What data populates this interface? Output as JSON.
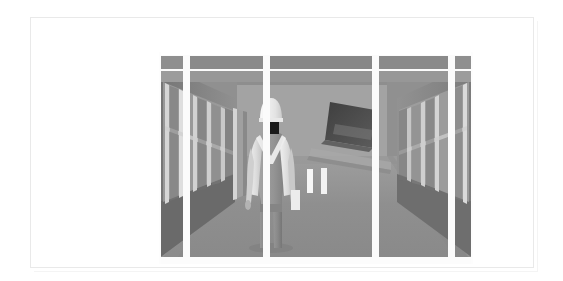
{
  "plate": {
    "background_color": "#ffffff",
    "frame_color": "#e9e9e9",
    "alt": "Greyscale 3D render: construction worker seen from behind standing in a corridor"
  },
  "scene": {
    "title": "corridor-3d-render",
    "description": "Greyscale architectural 3D render. A figure in a white hard hat and light overalls stands with their back to the viewer in the centre of a wide corridor. Glazed window walls recede in one-point perspective on both the left and right. A dark angled panel hangs from the ceiling to the right. Two small white vertical markers stand on the floor to the right of the figure.",
    "view": "one-point perspective, eye level",
    "palette": {
      "floor": "#8d8d8d",
      "floor_far": "#9d9d9d",
      "ceiling_band": "#9a9a9a",
      "ceiling_band_dark": "#828282",
      "wall_left": "#7e7e7e",
      "wall_right": "#868686",
      "back_wall": "#a3a3a3",
      "mullion_light": "#c9c9c9",
      "mullion_white": "#f2f2f2",
      "glass": "#9b9b9b",
      "glass_dark": "#6f6f6f",
      "spandrel": "#6a6a6a",
      "column_white": "#fbfbfb",
      "dark_panel": "#4a4a4a",
      "marker_white": "#f6f6f6",
      "figure_helmet": "#f0f0f0",
      "figure_head_shadow": "#1a1a1a",
      "figure_jacket": "#e2e2e2",
      "figure_vest": "#9b9b9b",
      "figure_legs": "#8a8a8a",
      "figure_shadow": "#6d6d6d"
    },
    "elements": {
      "figure": {
        "name": "worker-figure",
        "pose": "standing, back to camera",
        "helmet": "white hard hat",
        "garment": "light jacket over grey bib overalls",
        "carrying": "light rectangular object in right hand"
      },
      "ceiling_bands": {
        "name": "ceiling-beam-bands",
        "count": 5,
        "note": "segmented grey bands across the top separated by white gaps"
      },
      "left_window_wall": {
        "name": "left-window-wall",
        "bay_count": 4
      },
      "right_window_wall": {
        "name": "right-window-wall",
        "bay_count": 4
      },
      "dark_panel": {
        "name": "hanging-dark-panel",
        "note": "dark angled quadrilateral suspended upper right"
      },
      "floor_markers": {
        "name": "floor-markers",
        "count": 2,
        "color": "#f6f6f6"
      },
      "outer_columns": {
        "name": "foreground-columns",
        "count": 4,
        "color": "#fbfbfb"
      }
    }
  }
}
